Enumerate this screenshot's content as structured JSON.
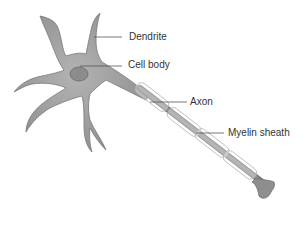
{
  "diagram": {
    "colors": {
      "cell_fill": "#9a9a9a",
      "cell_stroke": "#6e6e6e",
      "nucleus_fill": "#8a8a8a",
      "myelin_stroke": "#b5b5b5",
      "leader_line": "#555555",
      "label_text": "#333333"
    },
    "labels": [
      {
        "id": "dendrite",
        "text": "Dendrite"
      },
      {
        "id": "cell-body",
        "text": "Cell body"
      },
      {
        "id": "axon",
        "text": "Axon"
      },
      {
        "id": "myelin-sheath",
        "text": "Myelin sheath"
      }
    ]
  }
}
